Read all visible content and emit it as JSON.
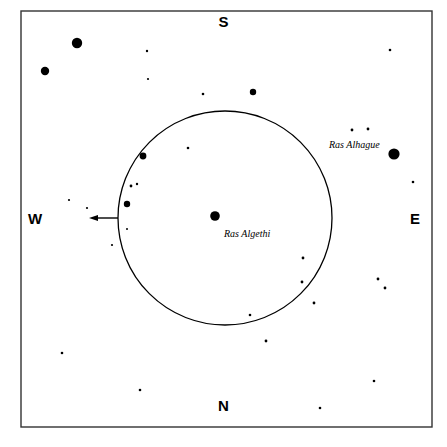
{
  "chart_data": {
    "type": "scatter",
    "title": "",
    "subtitle": "",
    "xlabel": "",
    "ylabel": "",
    "grid": false,
    "legend": null,
    "xlim": [
      0,
      447
    ],
    "ylim": [
      0,
      447
    ],
    "frame": {
      "x": 21,
      "y": 11,
      "width": 411,
      "height": 416,
      "stroke": "#333333",
      "stroke_width": 1.4
    },
    "field_circle": {
      "cx": 225,
      "cy": 218,
      "r": 107,
      "stroke": "#000000",
      "stroke_width": 1.3,
      "fill": "none"
    },
    "arrow": {
      "x1": 118,
      "y1": 218,
      "x2": 89,
      "y2": 218,
      "head_width": 9,
      "head_height": 6,
      "direction": "west",
      "stroke": "#000000",
      "stroke_width": 1.4
    },
    "stars": [
      {
        "cx": 77,
        "cy": 43,
        "r": 5.2,
        "mag_class": "bright"
      },
      {
        "cx": 45,
        "cy": 71,
        "r": 4.2,
        "mag_class": "bright"
      },
      {
        "cx": 253,
        "cy": 92,
        "r": 3.2,
        "mag_class": "medium"
      },
      {
        "cx": 394,
        "cy": 154,
        "r": 5.6,
        "mag_class": "bright"
      },
      {
        "cx": 215,
        "cy": 216,
        "r": 4.8,
        "mag_class": "bright"
      },
      {
        "cx": 143,
        "cy": 156,
        "r": 3.4,
        "mag_class": "medium"
      },
      {
        "cx": 127,
        "cy": 204,
        "r": 3.2,
        "mag_class": "medium"
      },
      {
        "cx": 131,
        "cy": 186,
        "r": 1.4,
        "mag_class": "faint"
      },
      {
        "cx": 137,
        "cy": 184,
        "r": 1.2,
        "mag_class": "faint"
      },
      {
        "cx": 127,
        "cy": 229,
        "r": 1.0,
        "mag_class": "faint"
      },
      {
        "cx": 112,
        "cy": 245,
        "r": 1.1,
        "mag_class": "faint"
      },
      {
        "cx": 147,
        "cy": 51,
        "r": 1.2,
        "mag_class": "faint"
      },
      {
        "cx": 148,
        "cy": 79,
        "r": 1.1,
        "mag_class": "faint"
      },
      {
        "cx": 203,
        "cy": 94,
        "r": 1.3,
        "mag_class": "faint"
      },
      {
        "cx": 188,
        "cy": 148,
        "r": 1.3,
        "mag_class": "faint"
      },
      {
        "cx": 69,
        "cy": 200,
        "r": 1.1,
        "mag_class": "faint"
      },
      {
        "cx": 87,
        "cy": 208,
        "r": 1.1,
        "mag_class": "faint"
      },
      {
        "cx": 62,
        "cy": 353,
        "r": 1.3,
        "mag_class": "faint"
      },
      {
        "cx": 140,
        "cy": 390,
        "r": 1.3,
        "mag_class": "faint"
      },
      {
        "cx": 303,
        "cy": 258,
        "r": 1.4,
        "mag_class": "faint"
      },
      {
        "cx": 302,
        "cy": 282,
        "r": 1.4,
        "mag_class": "faint"
      },
      {
        "cx": 314,
        "cy": 303,
        "r": 1.4,
        "mag_class": "faint"
      },
      {
        "cx": 250,
        "cy": 315,
        "r": 1.3,
        "mag_class": "faint"
      },
      {
        "cx": 266,
        "cy": 341,
        "r": 1.4,
        "mag_class": "faint"
      },
      {
        "cx": 378,
        "cy": 279,
        "r": 1.4,
        "mag_class": "faint"
      },
      {
        "cx": 385,
        "cy": 288,
        "r": 1.4,
        "mag_class": "faint"
      },
      {
        "cx": 374,
        "cy": 381,
        "r": 1.3,
        "mag_class": "faint"
      },
      {
        "cx": 320,
        "cy": 408,
        "r": 1.3,
        "mag_class": "faint"
      },
      {
        "cx": 390,
        "cy": 50,
        "r": 1.3,
        "mag_class": "faint"
      },
      {
        "cx": 352,
        "cy": 130,
        "r": 1.4,
        "mag_class": "faint"
      },
      {
        "cx": 368,
        "cy": 129,
        "r": 1.4,
        "mag_class": "faint"
      },
      {
        "cx": 413,
        "cy": 182,
        "r": 1.3,
        "mag_class": "faint"
      }
    ]
  },
  "compass": {
    "south": "S",
    "north": "N",
    "west": "W",
    "east": "E"
  },
  "labels": {
    "ras_algethi": "Ras Algethi",
    "ras_alhague": "Ras Alhague"
  },
  "colors": {
    "background": "#ffffff",
    "ink": "#000000",
    "frame": "#333333"
  }
}
